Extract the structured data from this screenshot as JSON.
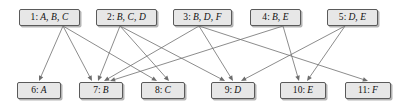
{
  "diagram": {
    "node_fill": "#e7e7e7",
    "node_border": "#5a5a5a",
    "edge_color": "#6e6e6e",
    "background": "#ffffff",
    "set_nodes": [
      {
        "id": 1,
        "index": "1:",
        "label": "A, B, C",
        "text": "1: A, B, C",
        "x": 19,
        "y": 9,
        "w": 61,
        "h": 17
      },
      {
        "id": 2,
        "index": "2:",
        "label": "B, C, D",
        "text": "2: B, C, D",
        "x": 96,
        "y": 9,
        "w": 61,
        "h": 17
      },
      {
        "id": 3,
        "index": "3:",
        "label": "B, D, F",
        "text": "3: B, D, F",
        "x": 173,
        "y": 9,
        "w": 59,
        "h": 17
      },
      {
        "id": 4,
        "index": "4:",
        "label": "B, E",
        "text": "4: B, E",
        "x": 250,
        "y": 9,
        "w": 51,
        "h": 17
      },
      {
        "id": 5,
        "index": "5:",
        "label": "D, E",
        "text": "5: D, E",
        "x": 327,
        "y": 9,
        "w": 51,
        "h": 17
      }
    ],
    "element_nodes": [
      {
        "id": 6,
        "index": "6:",
        "label": "A",
        "text": "6: A",
        "x": 17,
        "y": 82,
        "w": 44,
        "h": 17
      },
      {
        "id": 7,
        "index": "7:",
        "label": "B",
        "text": "7: B",
        "x": 79,
        "y": 82,
        "w": 44,
        "h": 17
      },
      {
        "id": 8,
        "index": "8:",
        "label": "C",
        "text": "8: C",
        "x": 141,
        "y": 82,
        "w": 44,
        "h": 17
      },
      {
        "id": 9,
        "index": "9:",
        "label": "D",
        "text": "9: D",
        "x": 211,
        "y": 82,
        "w": 44,
        "h": 17
      },
      {
        "id": 10,
        "index": "10:",
        "label": "E",
        "text": "10: E",
        "x": 280,
        "y": 82,
        "w": 46,
        "h": 17
      },
      {
        "id": 11,
        "index": "11:",
        "label": "F",
        "text": "11: F",
        "x": 345,
        "y": 82,
        "w": 46,
        "h": 17
      }
    ],
    "edges": [
      {
        "from": 1,
        "to": 6,
        "label": "A"
      },
      {
        "from": 1,
        "to": 7,
        "label": "B"
      },
      {
        "from": 1,
        "to": 8,
        "label": "C"
      },
      {
        "from": 2,
        "to": 7,
        "label": "B"
      },
      {
        "from": 2,
        "to": 8,
        "label": "C"
      },
      {
        "from": 2,
        "to": 9,
        "label": "D"
      },
      {
        "from": 3,
        "to": 7,
        "label": "B"
      },
      {
        "from": 3,
        "to": 9,
        "label": "D"
      },
      {
        "from": 3,
        "to": 11,
        "label": "F"
      },
      {
        "from": 4,
        "to": 7,
        "label": "B"
      },
      {
        "from": 4,
        "to": 10,
        "label": "E"
      },
      {
        "from": 5,
        "to": 9,
        "label": "D"
      },
      {
        "from": 5,
        "to": 10,
        "label": "E"
      }
    ],
    "edge_anchors": {
      "1": {
        "x": 63,
        "y": 26
      },
      "2": {
        "x": 120,
        "y": 26
      },
      "3": {
        "x": 199,
        "y": 26
      },
      "4": {
        "x": 283,
        "y": 26
      },
      "5": {
        "x": 345,
        "y": 26
      },
      "6": {
        "x": 39,
        "y": 81
      },
      "7": {
        "x": 101,
        "y": 81
      },
      "8": {
        "x": 163,
        "y": 81
      },
      "9": {
        "x": 233,
        "y": 81
      },
      "10": {
        "x": 303,
        "y": 81
      },
      "11": {
        "x": 368,
        "y": 81
      }
    },
    "arrow_spread": {
      "7": [
        -9,
        -3,
        3,
        9
      ],
      "8": [
        -6,
        6
      ],
      "9": [
        -8,
        0,
        8
      ],
      "10": [
        -4,
        4
      ],
      "11": [
        0
      ],
      "6": [
        0
      ]
    }
  }
}
